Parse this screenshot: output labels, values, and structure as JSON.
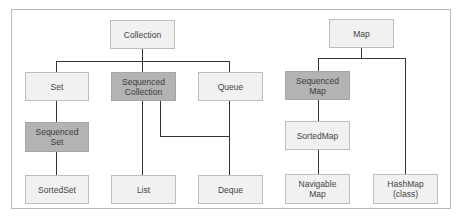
{
  "diagram": {
    "title": "",
    "colors": {
      "light_fill": "#f1f1f1",
      "highlight_fill": "#b3b3b3",
      "line": "#333333",
      "border": "#bdbdbd"
    },
    "nodes": {
      "collection": {
        "label": "Collection",
        "highlighted": false
      },
      "set": {
        "label": "Set",
        "highlighted": false
      },
      "sequenced_collection": {
        "label": "Sequenced\nCollection",
        "highlighted": true
      },
      "queue": {
        "label": "Queue",
        "highlighted": false
      },
      "sequenced_set": {
        "label": "Sequenced\nSet",
        "highlighted": true
      },
      "sorted_set": {
        "label": "SortedSet",
        "highlighted": false
      },
      "list": {
        "label": "List",
        "highlighted": false
      },
      "deque": {
        "label": "Deque",
        "highlighted": false
      },
      "map": {
        "label": "Map",
        "highlighted": false
      },
      "sequenced_map": {
        "label": "Sequenced\nMap",
        "highlighted": true
      },
      "sorted_map": {
        "label": "SortedMap",
        "highlighted": false
      },
      "navigable_map": {
        "label": "Navigable\nMap",
        "highlighted": false
      },
      "hashmap": {
        "label": "HashMap\n(class)",
        "highlighted": false
      }
    },
    "edges": [
      [
        "collection",
        "set"
      ],
      [
        "collection",
        "sequenced_collection"
      ],
      [
        "collection",
        "queue"
      ],
      [
        "set",
        "sequenced_set"
      ],
      [
        "sequenced_set",
        "sorted_set"
      ],
      [
        "sequenced_collection",
        "list"
      ],
      [
        "sequenced_collection",
        "deque"
      ],
      [
        "queue",
        "deque"
      ],
      [
        "map",
        "sequenced_map"
      ],
      [
        "map",
        "hashmap"
      ],
      [
        "sequenced_map",
        "sorted_map"
      ],
      [
        "sorted_map",
        "navigable_map"
      ]
    ]
  }
}
